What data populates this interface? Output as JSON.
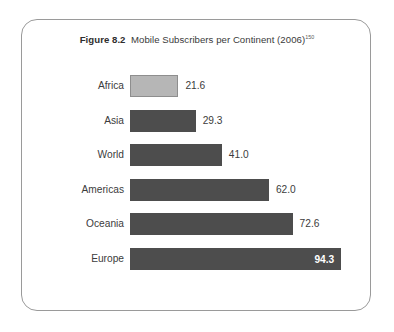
{
  "figure": {
    "number": "Figure 8.2",
    "caption": "Mobile Subscribers per Continent (2006)",
    "footnote_marker": "150"
  },
  "colors": {
    "bar_dark": "#4d4d4d",
    "bar_light": "#b6b6b6",
    "bar_light_border": "#8e8e8e",
    "frame_border": "#9a9a9a",
    "text": "#3c3c3c",
    "value_inside_text": "#ffffff",
    "background": "#ffffff"
  },
  "chart_data": {
    "type": "bar",
    "orientation": "horizontal",
    "xlabel": "",
    "ylabel": "",
    "xlim": [
      0,
      100
    ],
    "grid": false,
    "legend": null,
    "categories": [
      "Africa",
      "Asia",
      "World",
      "Americas",
      "Oceania",
      "Europe"
    ],
    "values": [
      21.6,
      29.3,
      41.0,
      62.0,
      72.6,
      94.3
    ],
    "value_labels": [
      "21.6",
      "29.3",
      "41.0",
      "62.0",
      "72.6",
      "94.3"
    ],
    "bars": [
      {
        "category": "Africa",
        "value": 21.6,
        "label": "21.6",
        "style": "light",
        "label_position": "outside"
      },
      {
        "category": "Asia",
        "value": 29.3,
        "label": "29.3",
        "style": "dark",
        "label_position": "outside"
      },
      {
        "category": "World",
        "value": 41.0,
        "label": "41.0",
        "style": "dark",
        "label_position": "outside"
      },
      {
        "category": "Americas",
        "value": 62.0,
        "label": "62.0",
        "style": "dark",
        "label_position": "outside"
      },
      {
        "category": "Oceania",
        "value": 72.6,
        "label": "72.6",
        "style": "dark",
        "label_position": "outside"
      },
      {
        "category": "Europe",
        "value": 94.3,
        "label": "94.3",
        "style": "dark",
        "label_position": "inside"
      }
    ]
  }
}
